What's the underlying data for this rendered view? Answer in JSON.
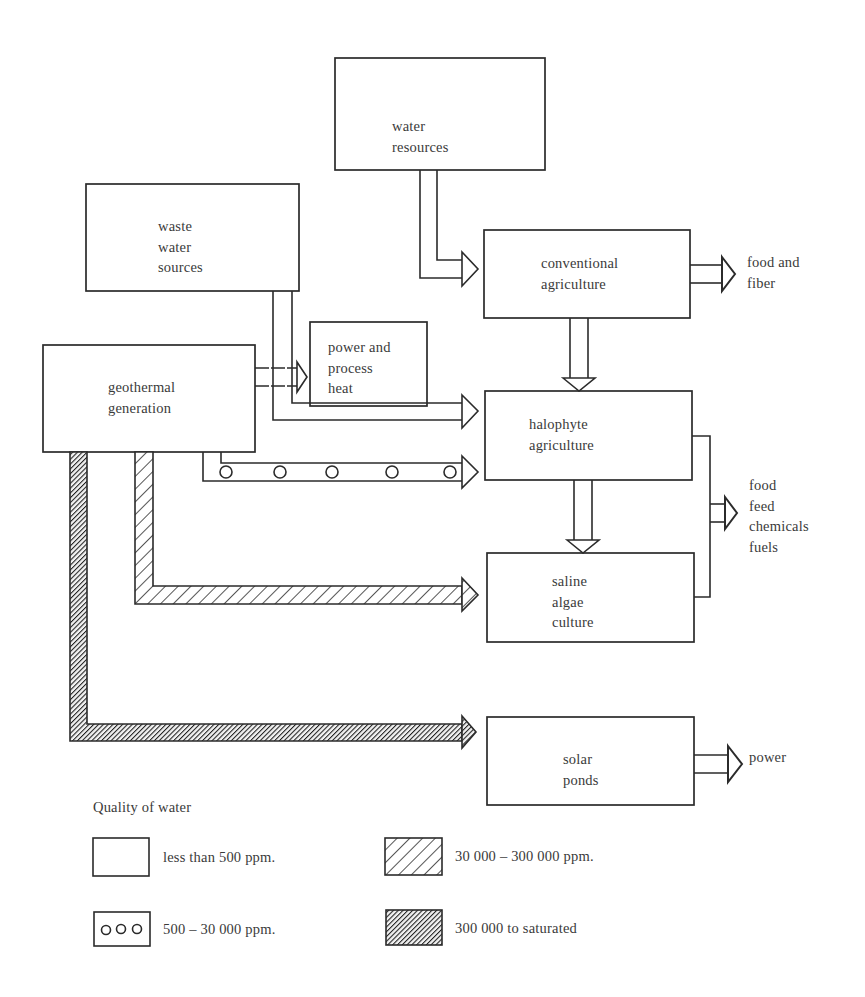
{
  "nodes": {
    "water_resources": {
      "lines": [
        "water",
        "resources"
      ]
    },
    "waste_water_sources": {
      "lines": [
        "waste",
        "water",
        "sources"
      ]
    },
    "geothermal_generation": {
      "lines": [
        "geothermal",
        "generation"
      ]
    },
    "power_and_process_heat": {
      "lines": [
        "power and",
        "process",
        "heat"
      ]
    },
    "conventional_agriculture": {
      "lines": [
        "conventional",
        "agriculture"
      ]
    },
    "halophyte_agriculture": {
      "lines": [
        "halophyte",
        "agriculture"
      ]
    },
    "saline_algae_culture": {
      "lines": [
        "saline",
        "algae",
        "culture"
      ]
    },
    "solar_ponds": {
      "lines": [
        "solar",
        "ponds"
      ]
    }
  },
  "outputs": {
    "food_and_fiber": {
      "lines": [
        "food and",
        "fiber"
      ]
    },
    "food_feed_chemicals_fuels": {
      "lines": [
        "food",
        "feed",
        "chemicals",
        "fuels"
      ]
    },
    "power": {
      "lines": [
        "power"
      ]
    }
  },
  "flows": [
    {
      "from": "water resources",
      "to": "conventional agriculture",
      "quality": "less than 500 ppm."
    },
    {
      "from": "waste water sources",
      "to": "halophyte agriculture",
      "quality": "less than 500 ppm."
    },
    {
      "from": "geothermal generation",
      "to": "power and process heat",
      "quality": "less than 500 ppm."
    },
    {
      "from": "geothermal generation",
      "to": "halophyte agriculture",
      "quality": "500 – 30 000 ppm."
    },
    {
      "from": "geothermal generation",
      "to": "saline algae culture",
      "quality": "30 000 – 300 000 ppm."
    },
    {
      "from": "geothermal generation",
      "to": "solar ponds",
      "quality": "300 000 to saturated"
    },
    {
      "from": "conventional agriculture",
      "to": "halophyte agriculture",
      "quality": "less than 500 ppm."
    },
    {
      "from": "halophyte agriculture",
      "to": "saline algae culture",
      "quality": "less than 500 ppm."
    },
    {
      "from": "conventional agriculture",
      "to": "food and fiber"
    },
    {
      "from": "halophyte agriculture + saline algae culture",
      "to": "food feed chemicals fuels"
    },
    {
      "from": "solar ponds",
      "to": "power"
    }
  ],
  "legend": {
    "title": "Quality of water",
    "items": [
      {
        "pattern": "plain",
        "label": "less than 500 ppm."
      },
      {
        "pattern": "circles",
        "label": "500 – 30 000 ppm."
      },
      {
        "pattern": "coarse-hatch",
        "label": "30 000 – 300 000 ppm."
      },
      {
        "pattern": "dense-hatch",
        "label": "300 000 to saturated"
      }
    ]
  },
  "colors": {
    "line": "#2b2b2b",
    "text": "#3a3a3a",
    "dense_fill": "#1e1e1e",
    "background": "#ffffff"
  }
}
